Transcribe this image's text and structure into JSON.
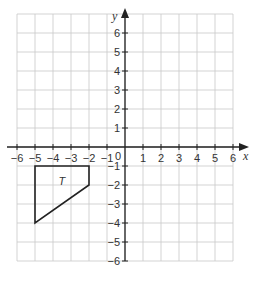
{
  "diagram": {
    "type": "coordinate-grid",
    "x_axis": {
      "label": "x",
      "min": -6,
      "max": 6,
      "ticks": [
        "-6",
        "-5",
        "-4",
        "-3",
        "-2",
        "-1",
        "1",
        "2",
        "3",
        "4",
        "5",
        "6"
      ]
    },
    "y_axis": {
      "label": "y",
      "min": -6,
      "max": 7,
      "ticks": [
        "6",
        "5",
        "4",
        "3",
        "2",
        "1",
        "-1",
        "-2",
        "-3",
        "-4",
        "-5",
        "-6"
      ]
    },
    "origin_label": "0",
    "shape": {
      "label": "T",
      "vertices": [
        [
          -5,
          -1
        ],
        [
          -2,
          -1
        ],
        [
          -2,
          -2
        ],
        [
          -5,
          -4
        ]
      ]
    },
    "colors": {
      "grid": "#c8c8c8",
      "axis": "#222222",
      "shape": "#222222"
    }
  }
}
